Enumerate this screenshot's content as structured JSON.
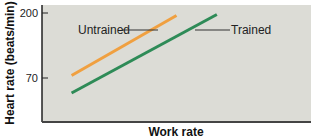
{
  "chart_data": {
    "type": "line",
    "title": "",
    "xlabel": "Work rate",
    "ylabel": "Heart rate (beats/min)",
    "ylim": [
      0,
      220
    ],
    "xlim": [
      0,
      100
    ],
    "grid": false,
    "yticks": [
      {
        "value": 200,
        "label": "200"
      },
      {
        "value": 70,
        "label": "70"
      }
    ],
    "series": [
      {
        "name": "Untrained",
        "color": "#f0a040",
        "x": [
          11,
          50
        ],
        "y": [
          75,
          195
        ]
      },
      {
        "name": "Trained",
        "color": "#2e8b57",
        "x": [
          11,
          65
        ],
        "y": [
          40,
          197
        ]
      }
    ],
    "annotations": [
      {
        "text": "Untrained",
        "series": "Untrained"
      },
      {
        "text": "Trained",
        "series": "Trained"
      }
    ],
    "plot_background": "#dcdcd6"
  }
}
